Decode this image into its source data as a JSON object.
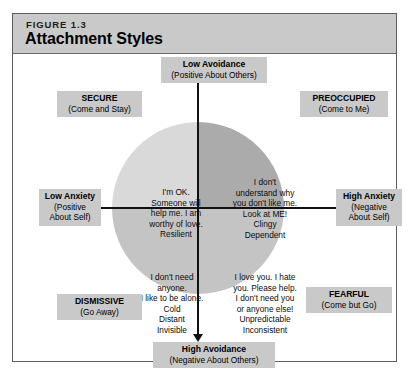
{
  "figure": {
    "number": "FIGURE 1.3",
    "title": "Attachment Styles"
  },
  "axes": {
    "top": {
      "main": "Low Avoidance",
      "sub": "(Positive About Others)"
    },
    "bottom": {
      "main": "High Avoidance",
      "sub": "(Negative About Others)"
    },
    "left": {
      "main": "Low Anxiety",
      "sub": "(Positive\nAbout Self)"
    },
    "right": {
      "main": "High Anxiety",
      "sub": "(Negative\nAbout Self)"
    }
  },
  "styles": {
    "secure": {
      "name": "SECURE",
      "motto": "(Come and Stay)",
      "description": "I'm OK.\nSomeone will\nhelp me. I am\nworthy of love.\nResilient"
    },
    "preoccupied": {
      "name": "PREOCCUPIED",
      "motto": "(Come to Me)",
      "description": "I don't\nunderstand why\nyou don't like me.\nLook at ME!\nClingy\nDependent"
    },
    "dismissive": {
      "name": "DISMISSIVE",
      "motto": "(Go Away)",
      "description": "I don't need\nanyone.\nI like to be alone.\nCold\nDistant\nInvisible"
    },
    "fearful": {
      "name": "FEARFUL",
      "motto": "(Come but Go)",
      "description": "I love you. I hate\nyou. Please help.\nI don't need you\nor anyone else!\nUnpredictable\nInconsistent"
    }
  },
  "colors": {
    "header_band": "#c9c9c9",
    "label_band": "#c9c9c9",
    "frame_border": "#5d5d5d",
    "quadrant_secure": "#d9d9d9",
    "quadrant_preoccupied": "#ababab",
    "quadrant_dismissive": "#c4c4c4",
    "quadrant_fearful": "#c4c4c4",
    "axis_line": "#111111"
  }
}
